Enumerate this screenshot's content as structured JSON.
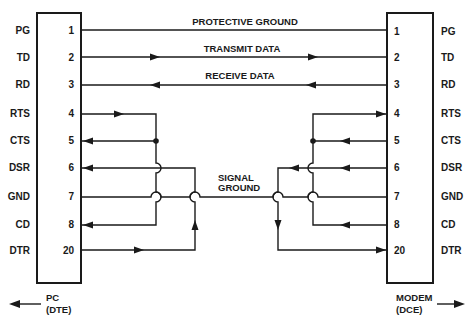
{
  "diagram": {
    "type": "RS-232 null modem cable wiring",
    "left_device": {
      "name": "PC",
      "role": "(DTE)",
      "pins": [
        {
          "signal": "PG",
          "pin": "1"
        },
        {
          "signal": "TD",
          "pin": "2"
        },
        {
          "signal": "RD",
          "pin": "3"
        },
        {
          "signal": "RTS",
          "pin": "4"
        },
        {
          "signal": "CTS",
          "pin": "5"
        },
        {
          "signal": "DSR",
          "pin": "6"
        },
        {
          "signal": "GND",
          "pin": "7"
        },
        {
          "signal": "CD",
          "pin": "8"
        },
        {
          "signal": "DTR",
          "pin": "20"
        }
      ]
    },
    "right_device": {
      "name": "MODEM",
      "role": "(DCE)",
      "pins": [
        {
          "signal": "PG",
          "pin": "1"
        },
        {
          "signal": "TD",
          "pin": "2"
        },
        {
          "signal": "RD",
          "pin": "3"
        },
        {
          "signal": "RTS",
          "pin": "4"
        },
        {
          "signal": "CTS",
          "pin": "5"
        },
        {
          "signal": "DSR",
          "pin": "6"
        },
        {
          "signal": "GND",
          "pin": "7"
        },
        {
          "signal": "CD",
          "pin": "8"
        },
        {
          "signal": "DTR",
          "pin": "20"
        }
      ]
    },
    "line_labels": {
      "pg": "PROTECTIVE GROUND",
      "td": "TRANSMIT DATA",
      "rd": "RECEIVE DATA",
      "gnd_line1": "SIGNAL",
      "gnd_line2": "GROUND"
    },
    "connections": [
      {
        "from": "PC:1",
        "to": "MODEM:1",
        "label": "PROTECTIVE GROUND",
        "direction": "none"
      },
      {
        "from": "PC:2",
        "to": "MODEM:2",
        "label": "TRANSMIT DATA",
        "direction": "left-to-right"
      },
      {
        "from": "MODEM:3",
        "to": "PC:3",
        "label": "RECEIVE DATA",
        "direction": "right-to-left"
      },
      {
        "from": "PC:4",
        "to": [
          "PC:5",
          "PC:8"
        ],
        "label": "local loopback",
        "direction": "loop"
      },
      {
        "from": "PC:20",
        "to": "PC:6",
        "label": "local loopback",
        "direction": "loop"
      },
      {
        "from": "PC:7",
        "to": "MODEM:7",
        "label": "SIGNAL GROUND",
        "direction": "none"
      },
      {
        "from": "MODEM:5",
        "to": [
          "MODEM:4",
          "MODEM:8"
        ],
        "label": "local loopback",
        "direction": "loop"
      },
      {
        "from": "MODEM:6",
        "to": "MODEM:20",
        "label": "local loopback",
        "direction": "loop"
      }
    ],
    "colors": {
      "ink": "#1a1a1a",
      "background": "#ffffff"
    }
  }
}
